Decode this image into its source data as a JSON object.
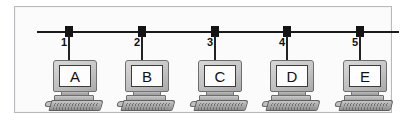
{
  "figure": {
    "frame": {
      "border_color": "#b9b9bd",
      "background_color": "#fbfbfb"
    },
    "bus": {
      "label": "bus-backbone",
      "color": "#1a1a1a"
    },
    "nodes": [
      {
        "number": "1",
        "letter": "A",
        "x": 54
      },
      {
        "number": "2",
        "letter": "B",
        "x": 127
      },
      {
        "number": "3",
        "letter": "C",
        "x": 200
      },
      {
        "number": "4",
        "letter": "D",
        "x": 272
      },
      {
        "number": "5",
        "letter": "E",
        "x": 345
      }
    ],
    "computers": [
      {
        "letter": "A",
        "x": 30
      },
      {
        "letter": "B",
        "x": 102
      },
      {
        "letter": "C",
        "x": 175
      },
      {
        "letter": "D",
        "x": 247
      },
      {
        "letter": "E",
        "x": 320
      }
    ]
  }
}
